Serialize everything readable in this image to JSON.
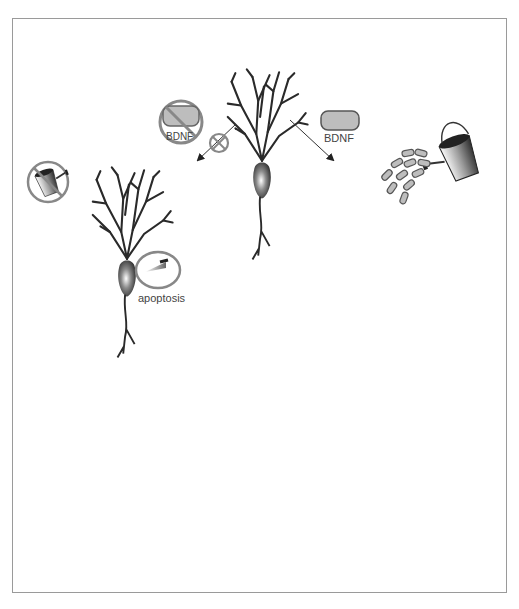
{
  "figure": {
    "labels": {
      "bdnf_blocked": "BDNF",
      "bdnf_supplied": "BDNF",
      "apoptosis": "apoptosis"
    },
    "panels": [
      {
        "id": "top",
        "name": "healthy-neuron",
        "state": "initial"
      },
      {
        "id": "left-middle",
        "name": "neuron-without-bdnf",
        "state": "apoptosis"
      },
      {
        "id": "left-bottom",
        "name": "degenerating-neuron",
        "state": "collapsed"
      },
      {
        "id": "right-middle",
        "name": "neuron-with-bdnf",
        "state": "watered"
      },
      {
        "id": "right-bottom",
        "name": "grown-neuron",
        "state": "enhanced-dendrites"
      }
    ],
    "icons": [
      "no-bdnf-icon",
      "inhibit-icon",
      "no-watering-can-icon",
      "knife-icon",
      "bdnf-capsule-icon",
      "watering-can-icon",
      "bdnf-particles-icon"
    ],
    "colors": {
      "frame": "#9a9a9a",
      "neuron": "#2a2a2a",
      "bdnf_fill": "#bdbdbd",
      "prohibit": "#888888",
      "arrow": "#333333"
    }
  }
}
